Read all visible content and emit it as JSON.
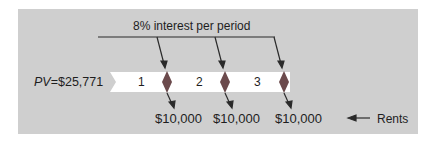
{
  "diagram": {
    "title_annotation": "8% interest per period",
    "present_value": {
      "symbol": "PV",
      "equals": "=",
      "amount": "$25,771"
    },
    "periods": [
      {
        "label": "1",
        "rent": "$10,000"
      },
      {
        "label": "2",
        "rent": "$10,000"
      },
      {
        "label": "3",
        "rent": "$10,000"
      }
    ],
    "legend": {
      "arrow": "←",
      "label": "Rents"
    },
    "colors": {
      "background": "#cfcfcf",
      "tape": "#ffffff",
      "marker": "#6b4a4c",
      "line": "#2a2a2a"
    }
  }
}
